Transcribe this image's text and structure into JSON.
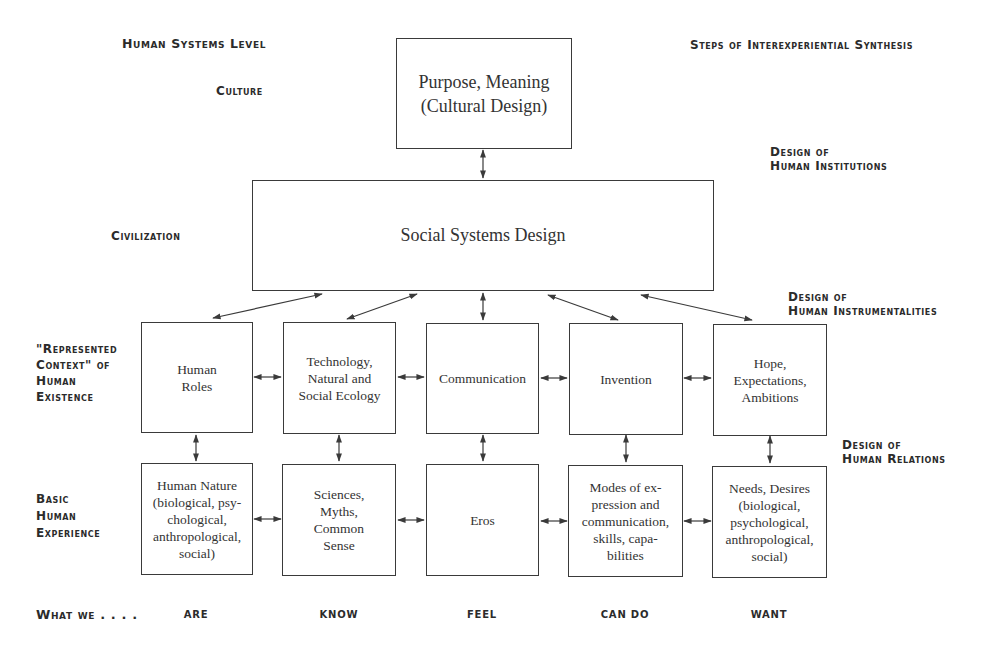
{
  "left_labels": {
    "header": "Human Systems Level",
    "culture": "Culture",
    "civilization": "Civilization",
    "represented_context": "\"Represented\nContext\" of\nHuman\nExistence",
    "basic_experience": "Basic\nHuman\nExperience",
    "what_we": "What we . . . ."
  },
  "right_labels": {
    "header": "Steps of Interexperiential Synthesis",
    "institutions": "Design of\nHuman Institutions",
    "instrumentalities": "Design of\nHuman Instrumentalities",
    "relations": "Design of\nHuman Relations"
  },
  "boxes": {
    "top": "Purpose, Meaning\n(Cultural Design)",
    "social": "Social Systems Design",
    "row1": [
      "Human\nRoles",
      "Technology,\nNatural and\nSocial Ecology",
      "Communication",
      "Invention",
      "Hope,\nExpectations,\nAmbitions"
    ],
    "row2": [
      "Human Nature\n(biological, psy-\nchological,\nanthropological,\nsocial)",
      "Sciences,\nMyths,\nCommon\nSense",
      "Eros",
      "Modes of ex-\npression and\ncommunication,\nskills, capa-\nbilities",
      "Needs, Desires\n(biological,\npsychological,\nanthropological,\nsocial)"
    ]
  },
  "bottom_labels": [
    "ARE",
    "KNOW",
    "FEEL",
    "CAN DO",
    "WANT"
  ],
  "colors": {
    "line": "#3a3a3a",
    "text": "#2b2b2b",
    "background": "#ffffff"
  }
}
